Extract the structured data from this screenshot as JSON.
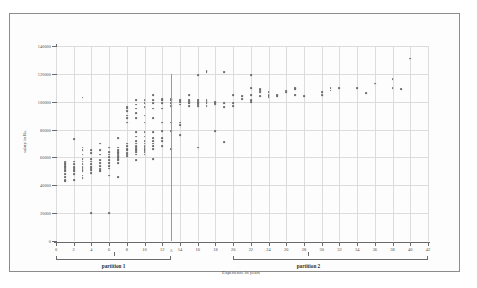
{
  "chart_data": {
    "type": "scatter",
    "title": "",
    "xlabel": "Experience in years",
    "ylabel": "salary in Rs.",
    "xlim": [
      0,
      42
    ],
    "ylim": [
      0,
      140000
    ],
    "xticks": [
      0,
      2,
      4,
      6,
      8,
      10,
      12,
      14,
      16,
      18,
      20,
      22,
      24,
      26,
      28,
      30,
      32,
      34,
      36,
      38,
      40,
      42
    ],
    "yticks": [
      0,
      20000,
      40000,
      60000,
      80000,
      100000,
      120000,
      140000
    ],
    "grid": true,
    "legend": "none",
    "annotations": {
      "divider_x": 13,
      "partition_1": {
        "label": "partition 1",
        "x_start": 0,
        "x_end": 13,
        "center": 6.5
      },
      "partition_2": {
        "label": "partition 2",
        "x_start": 20,
        "x_end": 42,
        "center": 28.5
      }
    },
    "points": [
      [
        1,
        44000
      ],
      [
        1,
        46000
      ],
      [
        1,
        48000
      ],
      [
        1,
        50000
      ],
      [
        1,
        51000
      ],
      [
        1,
        52000
      ],
      [
        1,
        53000
      ],
      [
        1,
        54000
      ],
      [
        1,
        55000
      ],
      [
        1,
        56000
      ],
      [
        1,
        57000
      ],
      [
        1,
        43000
      ],
      [
        2,
        44000
      ],
      [
        2,
        48000
      ],
      [
        2,
        50000
      ],
      [
        2,
        51000
      ],
      [
        2,
        52000
      ],
      [
        2,
        53000
      ],
      [
        2,
        55000
      ],
      [
        2,
        57000
      ],
      [
        2,
        73000
      ],
      [
        3,
        45000
      ],
      [
        3,
        47000
      ],
      [
        3,
        50000
      ],
      [
        3,
        51000
      ],
      [
        3,
        52000
      ],
      [
        3,
        53000
      ],
      [
        3,
        55000
      ],
      [
        3,
        57000
      ],
      [
        3,
        59000
      ],
      [
        3,
        62000
      ],
      [
        3,
        65000
      ],
      [
        3,
        67000
      ],
      [
        3,
        103000
      ],
      [
        4,
        20000
      ],
      [
        4,
        49000
      ],
      [
        4,
        51000
      ],
      [
        4,
        52000
      ],
      [
        4,
        53000
      ],
      [
        4,
        55000
      ],
      [
        4,
        57000
      ],
      [
        4,
        59000
      ],
      [
        4,
        63000
      ],
      [
        4,
        65000
      ],
      [
        5,
        50000
      ],
      [
        5,
        51000
      ],
      [
        5,
        52000
      ],
      [
        5,
        54000
      ],
      [
        5,
        56000
      ],
      [
        5,
        58000
      ],
      [
        5,
        62000
      ],
      [
        5,
        65000
      ],
      [
        5,
        70000
      ],
      [
        6,
        20000
      ],
      [
        6,
        47000
      ],
      [
        6,
        52000
      ],
      [
        6,
        54000
      ],
      [
        6,
        56000
      ],
      [
        6,
        58000
      ],
      [
        6,
        60000
      ],
      [
        6,
        62000
      ],
      [
        6,
        64000
      ],
      [
        6,
        67000
      ],
      [
        7,
        46000
      ],
      [
        7,
        56000
      ],
      [
        7,
        58000
      ],
      [
        7,
        59000
      ],
      [
        7,
        60000
      ],
      [
        7,
        61000
      ],
      [
        7,
        62000
      ],
      [
        7,
        63000
      ],
      [
        7,
        64000
      ],
      [
        7,
        65000
      ],
      [
        7,
        67000
      ],
      [
        7,
        74000
      ],
      [
        8,
        61000
      ],
      [
        8,
        62000
      ],
      [
        8,
        63000
      ],
      [
        8,
        65000
      ],
      [
        8,
        66000
      ],
      [
        8,
        68000
      ],
      [
        8,
        70000
      ],
      [
        8,
        85000
      ],
      [
        8,
        88000
      ],
      [
        8,
        90000
      ],
      [
        8,
        93000
      ],
      [
        8,
        95000
      ],
      [
        8,
        96000
      ],
      [
        9,
        58000
      ],
      [
        9,
        62000
      ],
      [
        9,
        64000
      ],
      [
        9,
        65000
      ],
      [
        9,
        66000
      ],
      [
        9,
        67000
      ],
      [
        9,
        68000
      ],
      [
        9,
        70000
      ],
      [
        9,
        72000
      ],
      [
        9,
        75000
      ],
      [
        9,
        78000
      ],
      [
        9,
        88000
      ],
      [
        9,
        92000
      ],
      [
        9,
        95000
      ],
      [
        9,
        98000
      ],
      [
        9,
        101000
      ],
      [
        10,
        62000
      ],
      [
        10,
        64000
      ],
      [
        10,
        65000
      ],
      [
        10,
        66000
      ],
      [
        10,
        67000
      ],
      [
        10,
        68000
      ],
      [
        10,
        70000
      ],
      [
        10,
        72000
      ],
      [
        10,
        75000
      ],
      [
        10,
        78000
      ],
      [
        10,
        85000
      ],
      [
        10,
        90000
      ],
      [
        10,
        96000
      ],
      [
        10,
        99000
      ],
      [
        10,
        101000
      ],
      [
        11,
        59000
      ],
      [
        11,
        66000
      ],
      [
        11,
        68000
      ],
      [
        11,
        70000
      ],
      [
        11,
        72000
      ],
      [
        11,
        74000
      ],
      [
        11,
        78000
      ],
      [
        11,
        88000
      ],
      [
        11,
        95000
      ],
      [
        11,
        99000
      ],
      [
        11,
        101000
      ],
      [
        11,
        105000
      ],
      [
        12,
        68000
      ],
      [
        12,
        72000
      ],
      [
        12,
        74000
      ],
      [
        12,
        79000
      ],
      [
        12,
        85000
      ],
      [
        12,
        95000
      ],
      [
        12,
        99000
      ],
      [
        12,
        101000
      ],
      [
        12,
        102000
      ],
      [
        13,
        66000
      ],
      [
        13,
        79000
      ],
      [
        13,
        85000
      ],
      [
        13,
        97000
      ],
      [
        13,
        99000
      ],
      [
        13,
        101000
      ],
      [
        13,
        102000
      ],
      [
        14,
        76000
      ],
      [
        14,
        83000
      ],
      [
        14,
        85000
      ],
      [
        14,
        98000
      ],
      [
        14,
        100000
      ],
      [
        14,
        101000
      ],
      [
        15,
        97000
      ],
      [
        15,
        99000
      ],
      [
        15,
        100000
      ],
      [
        15,
        101000
      ],
      [
        15,
        105000
      ],
      [
        16,
        67000
      ],
      [
        16,
        97000
      ],
      [
        16,
        98000
      ],
      [
        16,
        99000
      ],
      [
        16,
        100000
      ],
      [
        16,
        101000
      ],
      [
        16,
        119000
      ],
      [
        17,
        97000
      ],
      [
        17,
        99000
      ],
      [
        17,
        100000
      ],
      [
        17,
        101000
      ],
      [
        17,
        121000
      ],
      [
        17,
        122000
      ],
      [
        18,
        79000
      ],
      [
        18,
        98000
      ],
      [
        18,
        99000
      ],
      [
        18,
        100000
      ],
      [
        19,
        71000
      ],
      [
        19,
        96000
      ],
      [
        19,
        99000
      ],
      [
        19,
        121000
      ],
      [
        20,
        97000
      ],
      [
        20,
        99000
      ],
      [
        20,
        105000
      ],
      [
        21,
        102000
      ],
      [
        21,
        104000
      ],
      [
        22,
        100000
      ],
      [
        22,
        101000
      ],
      [
        22,
        105000
      ],
      [
        22,
        110000
      ],
      [
        22,
        119000
      ],
      [
        23,
        104000
      ],
      [
        23,
        107000
      ],
      [
        23,
        108000
      ],
      [
        23,
        109000
      ],
      [
        24,
        103000
      ],
      [
        24,
        104000
      ],
      [
        24,
        105000
      ],
      [
        24,
        107000
      ],
      [
        25,
        104000
      ],
      [
        25,
        105000
      ],
      [
        26,
        107000
      ],
      [
        26,
        108000
      ],
      [
        27,
        105000
      ],
      [
        27,
        109000
      ],
      [
        27,
        110000
      ],
      [
        28,
        104000
      ],
      [
        30,
        105000
      ],
      [
        30,
        107000
      ],
      [
        31,
        108000
      ],
      [
        31,
        110000
      ],
      [
        32,
        110000
      ],
      [
        34,
        110000
      ],
      [
        35,
        106000
      ],
      [
        36,
        113000
      ],
      [
        38,
        110000
      ],
      [
        38,
        116000
      ],
      [
        39,
        109000
      ],
      [
        40,
        131000
      ]
    ]
  }
}
